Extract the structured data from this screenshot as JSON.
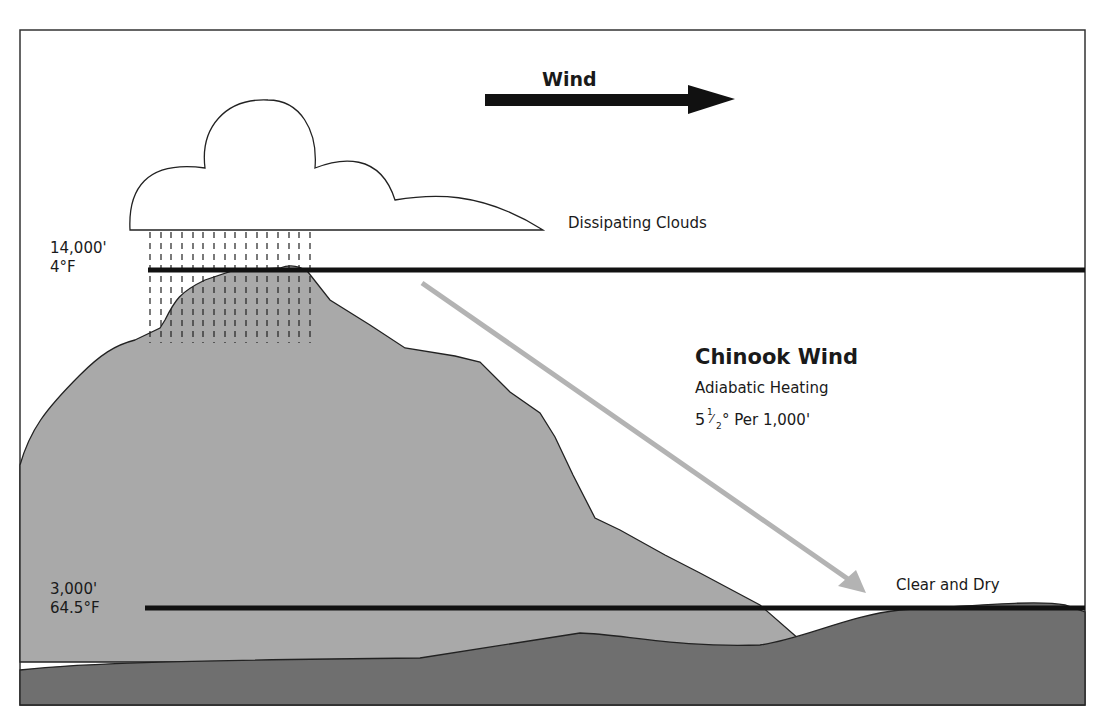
{
  "diagram": {
    "title": "Chinook Wind",
    "wind_label": "Wind",
    "cloud_label": "Dissipating Clouds",
    "subtitle": "Adiabatic Heating",
    "rate_prefix": "5",
    "rate_fraction_num": "1",
    "rate_fraction_den": "2",
    "rate_suffix": "° Per 1,000'",
    "result_label": "Clear and Dry",
    "levels": [
      {
        "altitude": "14,000'",
        "temperature": "4°F"
      },
      {
        "altitude": "3,000'",
        "temperature": "64.5°F"
      }
    ],
    "colors": {
      "mountain": "#a9a9a9",
      "ground": "#6f6f6f",
      "descending_arrow": "#b3b3b3",
      "line": "#111111",
      "frame": "#333333"
    }
  }
}
